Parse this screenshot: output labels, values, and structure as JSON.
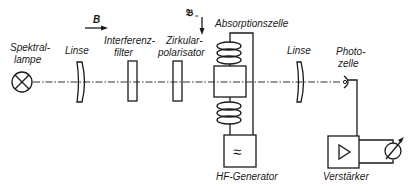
{
  "diagram": {
    "type": "optical-pumping experimental setup schematic",
    "components": [
      {
        "id": "spectral-lamp",
        "label_line1": "Spektral-",
        "label_line2": "lampe",
        "symbol": "circle-with-x"
      },
      {
        "id": "lens-1",
        "label": "Linse",
        "symbol": "lens"
      },
      {
        "id": "interference-filter",
        "label_line1": "Interferenz-",
        "label_line2": "filter",
        "symbol": "rectangle-plate"
      },
      {
        "id": "circular-polarizer",
        "label_line1": "Zirkular-",
        "label_line2": "polarisator",
        "symbol": "rectangle-plate"
      },
      {
        "id": "absorption-cell",
        "label": "Absorptionszelle",
        "symbol": "box-with-coils"
      },
      {
        "id": "hf-generator",
        "label": "HF-Generator",
        "symbol": "box-with-tilde",
        "glyph": "≈"
      },
      {
        "id": "lens-2",
        "label": "Linse",
        "symbol": "lens"
      },
      {
        "id": "photocell",
        "label_line1": "Photo-",
        "label_line2": "zelle",
        "symbol": "photocell"
      },
      {
        "id": "amplifier",
        "label": "Verstärker",
        "symbol": "box-with-triangle"
      },
      {
        "id": "meter",
        "label": "",
        "symbol": "circle-with-arrow"
      }
    ],
    "annotations": {
      "static_field": {
        "label": "B",
        "arrow": "right"
      },
      "rf_field": {
        "label": "𝔅",
        "subscript": "≈",
        "arrow": "down"
      }
    }
  }
}
